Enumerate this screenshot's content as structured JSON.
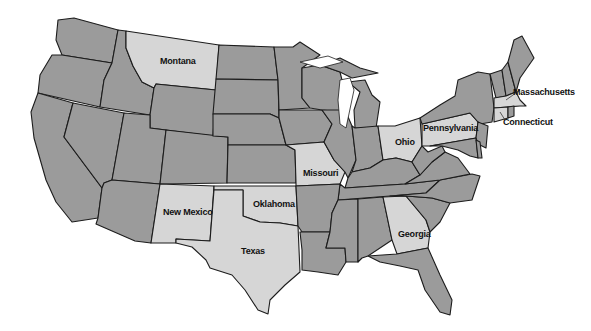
{
  "map": {
    "title": "United States (contiguous)",
    "colors": {
      "default_state": "#9b9b9b",
      "highlighted_state": "#d6d6d6",
      "border": "#1c1c1c",
      "background": "#ffffff"
    },
    "highlighted_states": [
      "Montana",
      "New Mexico",
      "Texas",
      "Oklahoma",
      "Missouri",
      "Ohio",
      "Pennsylvania",
      "Georgia",
      "Massachusetts",
      "Connecticut"
    ],
    "labels": {
      "montana": "Montana",
      "new_mexico": "New Mexico",
      "texas": "Texas",
      "oklahoma": "Oklahoma",
      "missouri": "Missouri",
      "ohio": "Ohio",
      "pennsylvania": "Pennsylvania",
      "georgia": "Georgia",
      "massachusetts": "Massachusetts",
      "connecticut": "Connecticut"
    }
  }
}
